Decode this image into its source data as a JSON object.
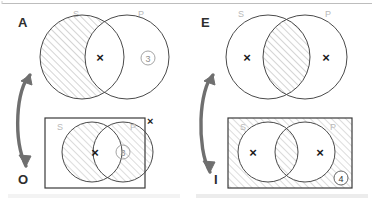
{
  "page": {
    "background_color": "#ffffff",
    "ink_color": "#2e2e2e",
    "faint_label_color": "#b9b9b9",
    "hatch_color": "#9a9a9a",
    "arrow_color": "#6f6f6f",
    "top_rule": true,
    "bottom_bars": 2
  },
  "diagrams": [
    {
      "id": "A",
      "letter": "A",
      "position": "top-left",
      "form": "universal-affirmative",
      "boxed": false,
      "set_labels": {
        "left": "S",
        "right": "P"
      },
      "shaded_regions": [
        "S-only"
      ],
      "x_marks": [
        {
          "region": "S-and-P",
          "label": "×"
        }
      ],
      "region_numbers": [
        {
          "region": "P-only",
          "label": "③",
          "value": 3
        }
      ]
    },
    {
      "id": "O",
      "letter": "O",
      "position": "bottom-left",
      "form": "particular-negative",
      "boxed": true,
      "set_labels": {
        "left": "S",
        "right": "P"
      },
      "shaded_regions": [
        "S-only",
        "P-only"
      ],
      "x_marks": [
        {
          "region": "S-and-P",
          "label": "×"
        },
        {
          "region": "outside-box-top-right",
          "label": "×"
        }
      ],
      "region_numbers": [
        {
          "region": "P-only",
          "label": "③",
          "value": 3
        }
      ]
    },
    {
      "id": "E",
      "letter": "E",
      "position": "top-right",
      "form": "universal-negative",
      "boxed": false,
      "set_labels": {
        "left": "S",
        "right": "P"
      },
      "shaded_regions": [
        "S-and-P"
      ],
      "x_marks": [
        {
          "region": "S-only",
          "label": "×"
        },
        {
          "region": "P-only",
          "label": "×"
        }
      ],
      "region_numbers": []
    },
    {
      "id": "I",
      "letter": "I",
      "position": "bottom-right",
      "form": "particular-affirmative",
      "boxed": true,
      "set_labels": {
        "left": "S",
        "right": "P"
      },
      "shaded_regions": [
        "outside-circles",
        "S-and-P"
      ],
      "x_marks": [
        {
          "region": "S-only",
          "label": "×"
        },
        {
          "region": "P-only",
          "label": "×"
        }
      ],
      "region_numbers": [
        {
          "region": "box-bottom-right",
          "label": "④",
          "value": 4
        }
      ]
    }
  ],
  "arrows": [
    {
      "id": "arrow-left",
      "from": "A",
      "to": "O",
      "style": "curved-double-headed"
    },
    {
      "id": "arrow-right",
      "from": "E",
      "to": "I",
      "style": "curved-double-headed"
    }
  ],
  "labels": {
    "A": "A",
    "O": "O",
    "E": "E",
    "I": "I",
    "S": "S",
    "P": "P",
    "x": "×",
    "three": "③",
    "four": "④"
  }
}
